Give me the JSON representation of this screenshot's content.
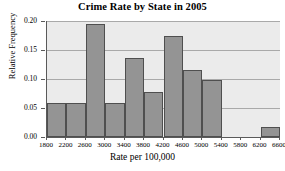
{
  "chart_data": {
    "type": "bar",
    "title": "Crime Rate by State in 2005",
    "xlabel": "Rate per 100,000",
    "ylabel": "Relative Frequency",
    "grid": true,
    "legend": "none",
    "xlim": [
      1800,
      6600
    ],
    "ylim": [
      0.0,
      0.2
    ],
    "bin_width": 400,
    "x_tick_labels": [
      "1800",
      "2200",
      "2600",
      "3000",
      "3400",
      "3800",
      "4200",
      "4600",
      "5000",
      "5400",
      "5800",
      "6200",
      "6600"
    ],
    "x_tick_values": [
      1800,
      2200,
      2600,
      3000,
      3400,
      3800,
      4200,
      4600,
      5000,
      5400,
      5800,
      6200,
      6600
    ],
    "y_tick_labels": [
      "0.00",
      "0.05",
      "0.10",
      "0.15",
      "0.20"
    ],
    "y_tick_values": [
      0.0,
      0.05,
      0.1,
      0.15,
      0.2
    ],
    "categories": [
      "1800-2200",
      "2200-2600",
      "2600-3000",
      "3000-3400",
      "3400-3800",
      "3800-4200",
      "4200-4600",
      "4600-5000",
      "5000-5400",
      "5400-5800",
      "5800-6200",
      "6200-6600"
    ],
    "values": [
      0.058,
      0.058,
      0.194,
      0.058,
      0.137,
      0.077,
      0.175,
      0.115,
      0.098,
      0.0,
      0.0,
      0.018
    ],
    "bar_color": "#949494",
    "bar_edge_color": "#4f4f4f",
    "plot_background": "#ebebeb",
    "grid_color": "#a9a9a9",
    "axis_color": "#5a5a5a"
  }
}
